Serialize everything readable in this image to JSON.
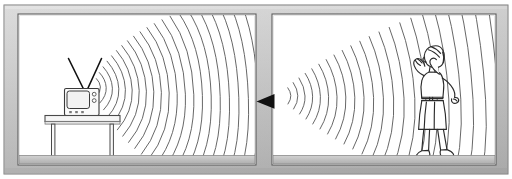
{
  "figure": {
    "background_color": "#ffffff",
    "width": 512,
    "height": 179,
    "frame": {
      "name": "outer-frame",
      "fill": "#c4c4c4",
      "fill_light": "#d8d8d8",
      "fill_dark": "#9a9a9a",
      "stroke": "#6b6b6b",
      "inner_fill": "#ffffff",
      "thickness": 18
    },
    "panels": [
      {
        "id": "left-panel",
        "label": "Television emitting sound waves",
        "x": 18,
        "y": 14,
        "width": 238,
        "height": 151
      },
      {
        "id": "right-panel",
        "label": "Woman listening to arriving sound waves",
        "x": 272,
        "y": 14,
        "width": 224,
        "height": 151
      }
    ],
    "objects": {
      "television": {
        "name": "television-set",
        "label": "Television",
        "screen_fill": "#f2f2f2",
        "body_fill": "#fbfbfb",
        "stroke": "#3a3a3a",
        "knob_count": 2,
        "button_count": 3
      },
      "antenna": {
        "name": "tv-antenna",
        "label": "Rabbit-ear antenna",
        "stroke": "#111111",
        "arms": 2
      },
      "table": {
        "name": "table",
        "label": "Table",
        "top_fill": "#f6f6f6",
        "stroke": "#4a4a4a",
        "leg_count": 2
      },
      "person": {
        "name": "listener-figure",
        "label": "Woman cupping her ears to listen",
        "stroke": "#2b2b2b",
        "fill": "#ffffff"
      },
      "arrow": {
        "name": "direction-arrow",
        "label": "Arrow pointing left",
        "fill": "#111111",
        "direction": "left"
      }
    },
    "waves": {
      "name": "sound-waves",
      "label": "Concentric sound wave arcs",
      "stroke": "#555555",
      "stroke_width": 0.9,
      "left_panel_arc_count": 21,
      "right_panel_arc_count": 23,
      "description": "Arcs widen as they travel away from the source"
    },
    "floor": {
      "name": "floor-line",
      "fill": "#bdbdbd",
      "stroke": "#7e7e7e"
    }
  }
}
